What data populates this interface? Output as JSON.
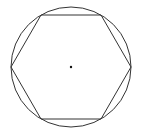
{
  "diagram": {
    "colors": {
      "stroke": "#333333",
      "background": "#ffffff",
      "center": "#111111"
    },
    "circle": {
      "cx": 71,
      "cy": 67,
      "r": 60
    },
    "hexagon": {
      "points": "11,67 41,15 101,15 131,67 101,119 41,119"
    },
    "center_point": {
      "cx": 71,
      "cy": 67,
      "r": 1.2
    }
  }
}
